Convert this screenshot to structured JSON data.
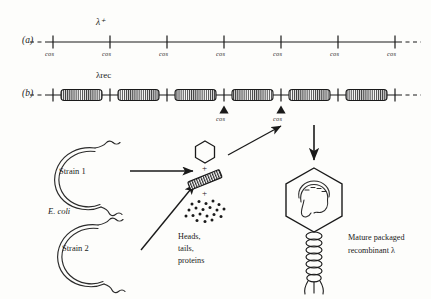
{
  "figure": {
    "background": "#fdfdfb",
    "ink": "#1a1a1a",
    "panels": [
      {
        "id": "a",
        "label": "(a)",
        "genome_label": "λ⁺",
        "site_label": "cos",
        "site_count": 7,
        "sites": [
          "cos",
          "cos",
          "cos",
          "cos",
          "cos",
          "cos",
          "cos"
        ],
        "dashed_ends": true
      },
      {
        "id": "b",
        "label": "(b)",
        "genome_label": "λrec",
        "site_label": "cos",
        "site_count": 7,
        "insert_count": 6,
        "arrow_labels": [
          "cos",
          "cos"
        ],
        "dashed_ends": true
      }
    ],
    "lower": {
      "strain_1": "Strain 1",
      "strain_2": "Strain 2",
      "host": "E. coli",
      "host_2": "E. coli",
      "components_plus": "+",
      "components_caption_lines": [
        "Heads,",
        "tails,",
        "proteins"
      ],
      "product_caption_lines": [
        "Mature packaged",
        "recombinant λ"
      ],
      "product_caption_italic_tail": "λ"
    }
  }
}
